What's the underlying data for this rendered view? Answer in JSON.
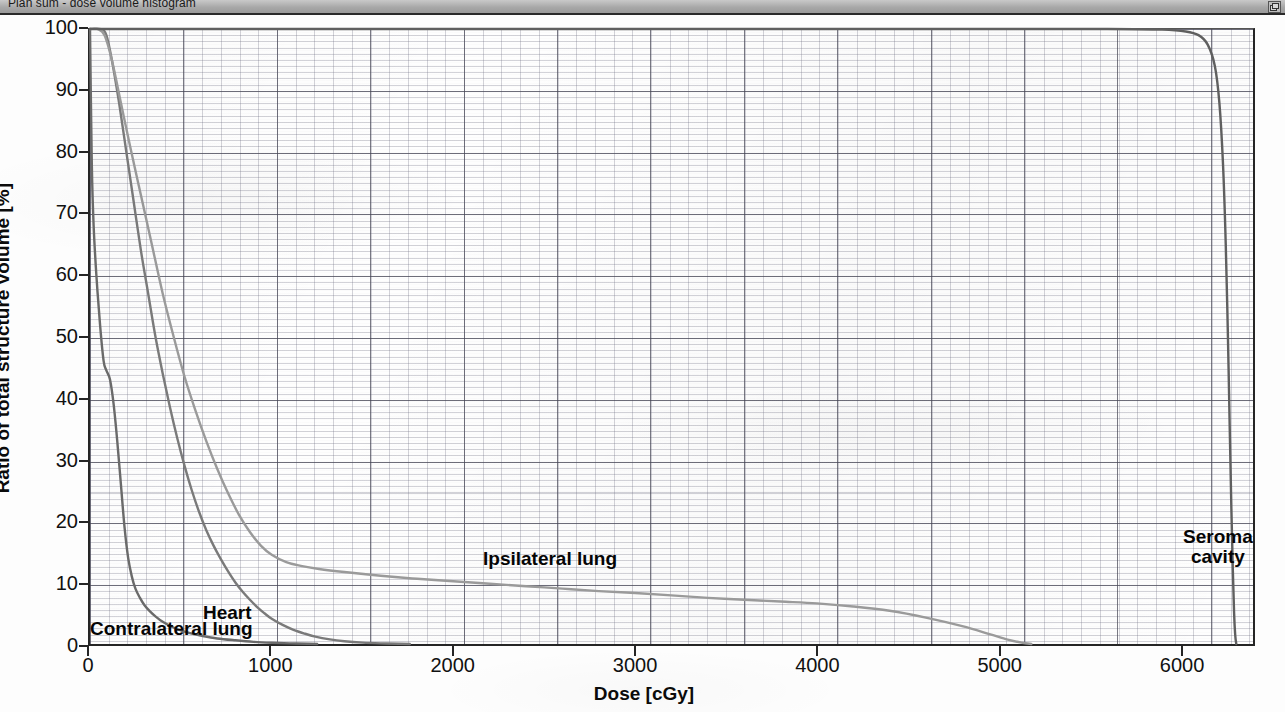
{
  "window": {
    "title": "Plan sum - dose volume histogram",
    "restore_button_icon": "restore-window-icon"
  },
  "chart_data": {
    "type": "line",
    "title": "Plan sum - dose volume histogram",
    "xlabel": "Dose [cGy]",
    "ylabel": "Ratio of total structure volume [%]",
    "xlim": [
      0,
      6400
    ],
    "ylim": [
      0,
      100
    ],
    "xticks": [
      0,
      1000,
      2000,
      3000,
      4000,
      5000,
      6000
    ],
    "xtick_labels": [
      "0",
      "1000",
      "2000",
      "3000",
      "4000",
      "5000",
      "6000"
    ],
    "yticks": [
      0,
      10,
      20,
      30,
      40,
      50,
      60,
      70,
      80,
      90,
      100
    ],
    "ytick_labels": [
      "0",
      "10",
      "20",
      "30",
      "40",
      "50",
      "60",
      "70",
      "80",
      "90",
      "100"
    ],
    "grid": true,
    "minor_grid": true,
    "legend": "inline-annotations",
    "series": [
      {
        "name": "Contralateral lung",
        "color": "#6a6a6a",
        "label_position": {
          "x": 90,
          "y": 604
        },
        "points": [
          [
            0,
            100
          ],
          [
            10,
            78
          ],
          [
            20,
            68
          ],
          [
            35,
            60
          ],
          [
            55,
            52
          ],
          [
            75,
            46
          ],
          [
            90,
            44.5
          ],
          [
            110,
            43
          ],
          [
            130,
            39
          ],
          [
            150,
            33
          ],
          [
            170,
            26
          ],
          [
            190,
            19
          ],
          [
            210,
            14
          ],
          [
            230,
            11
          ],
          [
            250,
            9
          ],
          [
            275,
            7.5
          ],
          [
            300,
            6.3
          ],
          [
            330,
            5.3
          ],
          [
            360,
            4.5
          ],
          [
            400,
            3.6
          ],
          [
            450,
            2.8
          ],
          [
            500,
            2.2
          ],
          [
            560,
            1.7
          ],
          [
            620,
            1.3
          ],
          [
            700,
            0.9
          ],
          [
            800,
            0.6
          ],
          [
            900,
            0.35
          ],
          [
            1000,
            0.2
          ],
          [
            1100,
            0.1
          ],
          [
            1200,
            0.03
          ],
          [
            1250,
            0
          ]
        ]
      },
      {
        "name": "Heart",
        "color": "#7a7a7a",
        "label_position": {
          "x": 203,
          "y": 588
        },
        "points": [
          [
            0,
            100
          ],
          [
            60,
            100
          ],
          [
            90,
            99
          ],
          [
            120,
            95
          ],
          [
            160,
            88
          ],
          [
            200,
            80
          ],
          [
            240,
            72
          ],
          [
            280,
            64
          ],
          [
            320,
            57
          ],
          [
            360,
            50
          ],
          [
            400,
            44
          ],
          [
            440,
            38.5
          ],
          [
            480,
            33.5
          ],
          [
            520,
            29
          ],
          [
            560,
            25
          ],
          [
            600,
            21.5
          ],
          [
            640,
            18.5
          ],
          [
            680,
            16
          ],
          [
            720,
            13.8
          ],
          [
            760,
            11.8
          ],
          [
            800,
            10
          ],
          [
            840,
            8.5
          ],
          [
            880,
            7.2
          ],
          [
            920,
            6
          ],
          [
            960,
            5
          ],
          [
            1000,
            4.1
          ],
          [
            1060,
            3.1
          ],
          [
            1120,
            2.3
          ],
          [
            1180,
            1.7
          ],
          [
            1240,
            1.2
          ],
          [
            1320,
            0.75
          ],
          [
            1400,
            0.45
          ],
          [
            1500,
            0.22
          ],
          [
            1600,
            0.1
          ],
          [
            1700,
            0.03
          ],
          [
            1760,
            0
          ]
        ]
      },
      {
        "name": "Ipsilateral lung",
        "color": "#9a9a9a",
        "label_position": {
          "x": 483,
          "y": 534
        },
        "points": [
          [
            0,
            100
          ],
          [
            40,
            100
          ],
          [
            80,
            99
          ],
          [
            120,
            95
          ],
          [
            170,
            88
          ],
          [
            220,
            81
          ],
          [
            280,
            73
          ],
          [
            340,
            65
          ],
          [
            400,
            57
          ],
          [
            460,
            50
          ],
          [
            520,
            43.5
          ],
          [
            580,
            38
          ],
          [
            640,
            33
          ],
          [
            700,
            28.5
          ],
          [
            760,
            24.5
          ],
          [
            820,
            21
          ],
          [
            880,
            18.2
          ],
          [
            940,
            16
          ],
          [
            1000,
            14.5
          ],
          [
            1080,
            13.3
          ],
          [
            1160,
            12.7
          ],
          [
            1260,
            12.2
          ],
          [
            1400,
            11.7
          ],
          [
            1600,
            11.1
          ],
          [
            1800,
            10.6
          ],
          [
            2000,
            10.2
          ],
          [
            2200,
            9.8
          ],
          [
            2400,
            9.4
          ],
          [
            2600,
            9.0
          ],
          [
            2800,
            8.6
          ],
          [
            3000,
            8.3
          ],
          [
            3200,
            7.9
          ],
          [
            3400,
            7.5
          ],
          [
            3600,
            7.2
          ],
          [
            3800,
            6.9
          ],
          [
            4000,
            6.6
          ],
          [
            4200,
            6.1
          ],
          [
            4400,
            5.4
          ],
          [
            4600,
            4.3
          ],
          [
            4800,
            2.9
          ],
          [
            4950,
            1.6
          ],
          [
            5050,
            0.7
          ],
          [
            5130,
            0.2
          ],
          [
            5180,
            0
          ]
        ]
      },
      {
        "name": "Seroma cavity",
        "color": "#5f5f5f",
        "label_position": {
          "x": 1183,
          "y": 512
        },
        "label_lines": [
          "Seroma",
          "cavity"
        ],
        "points": [
          [
            0,
            100
          ],
          [
            5000,
            100
          ],
          [
            5600,
            100
          ],
          [
            5900,
            99.9
          ],
          [
            6030,
            99.6
          ],
          [
            6100,
            99.0
          ],
          [
            6150,
            97.5
          ],
          [
            6190,
            94
          ],
          [
            6215,
            88
          ],
          [
            6235,
            78
          ],
          [
            6250,
            65
          ],
          [
            6262,
            50
          ],
          [
            6272,
            35
          ],
          [
            6281,
            22
          ],
          [
            6289,
            12
          ],
          [
            6296,
            5
          ],
          [
            6302,
            1.5
          ],
          [
            6308,
            0
          ]
        ]
      }
    ]
  }
}
